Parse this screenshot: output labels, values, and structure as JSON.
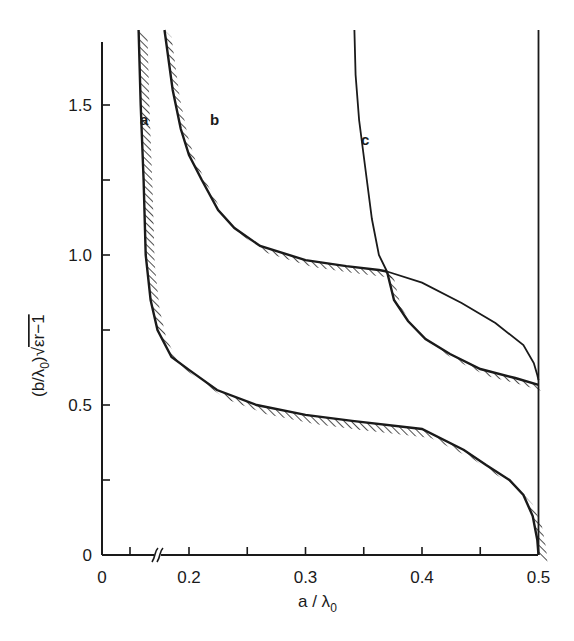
{
  "chart_data": {
    "type": "line",
    "title": "",
    "xlabel": "a/λ0",
    "ylabel": "(b/λ0)√(εr−1)",
    "xlim": [
      0,
      0.5
    ],
    "ylim": [
      0,
      1.72
    ],
    "x_axis_break": "between 0.05 and 0.2",
    "x_ticks": [
      {
        "value": 0,
        "label": "0"
      },
      {
        "value": 0.05,
        "label": ""
      },
      {
        "value": 0.2,
        "label": "0.2"
      },
      {
        "value": 0.25,
        "label": ""
      },
      {
        "value": 0.3,
        "label": "0.3"
      },
      {
        "value": 0.35,
        "label": ""
      },
      {
        "value": 0.4,
        "label": "0.4"
      },
      {
        "value": 0.45,
        "label": ""
      },
      {
        "value": 0.5,
        "label": "0.5"
      }
    ],
    "y_ticks": [
      {
        "value": 0,
        "label": "0"
      },
      {
        "value": 0.25,
        "label": ""
      },
      {
        "value": 0.5,
        "label": "0.5"
      },
      {
        "value": 0.75,
        "label": ""
      },
      {
        "value": 1.0,
        "label": "1.0"
      },
      {
        "value": 1.25,
        "label": ""
      },
      {
        "value": 1.5,
        "label": "1.5"
      }
    ],
    "grid": false,
    "legend": "none (curves labelled a, b, c directly)",
    "series": [
      {
        "name": "a",
        "hatched": true,
        "points": [
          [
            0.1567,
            1.75
          ],
          [
            0.1585,
            1.5
          ],
          [
            0.161,
            1.25
          ],
          [
            0.1628,
            1.0
          ],
          [
            0.167,
            0.85
          ],
          [
            0.173,
            0.75
          ],
          [
            0.185,
            0.66
          ],
          [
            0.2,
            0.617
          ],
          [
            0.224,
            0.55
          ],
          [
            0.258,
            0.5
          ],
          [
            0.3,
            0.467
          ],
          [
            0.34,
            0.447
          ],
          [
            0.4,
            0.42
          ],
          [
            0.436,
            0.35
          ],
          [
            0.455,
            0.3
          ],
          [
            0.475,
            0.25
          ],
          [
            0.487,
            0.2
          ],
          [
            0.495,
            0.13
          ],
          [
            0.499,
            0.05
          ],
          [
            0.5,
            0.0
          ]
        ]
      },
      {
        "name": "b",
        "hatched": true,
        "points": [
          [
            0.179,
            1.75
          ],
          [
            0.186,
            1.55
          ],
          [
            0.193,
            1.42
          ],
          [
            0.2,
            1.333
          ],
          [
            0.211,
            1.25
          ],
          [
            0.225,
            1.15
          ],
          [
            0.239,
            1.09
          ],
          [
            0.261,
            1.03
          ],
          [
            0.3,
            0.983
          ],
          [
            0.335,
            0.963
          ],
          [
            0.363,
            0.95
          ],
          [
            0.37,
            0.945
          ]
        ]
      },
      {
        "name": "b (continued beyond intersection with c, unhatched)",
        "hatched": false,
        "points": [
          [
            0.37,
            0.945
          ],
          [
            0.4,
            0.908
          ],
          [
            0.434,
            0.84
          ],
          [
            0.463,
            0.773
          ],
          [
            0.487,
            0.7
          ],
          [
            0.496,
            0.64
          ],
          [
            0.499,
            0.6
          ],
          [
            0.5,
            0.583
          ]
        ]
      },
      {
        "name": "c",
        "hatched": false,
        "points": [
          [
            0.342,
            1.75
          ],
          [
            0.343,
            1.6
          ],
          [
            0.346,
            1.45
          ],
          [
            0.351,
            1.3
          ],
          [
            0.357,
            1.12
          ],
          [
            0.363,
            1.0
          ],
          [
            0.37,
            0.945
          ]
        ]
      },
      {
        "name": "c (continued, hatched boundary)",
        "hatched": true,
        "points": [
          [
            0.37,
            0.945
          ],
          [
            0.376,
            0.85
          ],
          [
            0.388,
            0.78
          ],
          [
            0.403,
            0.72
          ],
          [
            0.424,
            0.67
          ],
          [
            0.45,
            0.62
          ],
          [
            0.48,
            0.59
          ],
          [
            0.5,
            0.567
          ]
        ]
      },
      {
        "name": "x = 0.5 boundary",
        "hatched": false,
        "points": [
          [
            0.5,
            0.0
          ],
          [
            0.5,
            1.78
          ]
        ]
      }
    ],
    "annotations": [
      {
        "text": "a",
        "x": 0.146,
        "y": 1.43
      },
      {
        "text": "b",
        "x": 0.218,
        "y": 1.43
      },
      {
        "text": "c",
        "x": 0.355,
        "y": 1.39
      }
    ]
  },
  "labels": {
    "xlabel_main": "a / λ",
    "xlabel_sub": "0",
    "ylabel_text": "(b/λ",
    "ylabel_sub": "0",
    "ylabel_rest": ")√",
    "ylabel_radicand": "εr−1",
    "curve_a": "a",
    "curve_b": "b",
    "curve_c": "c"
  }
}
